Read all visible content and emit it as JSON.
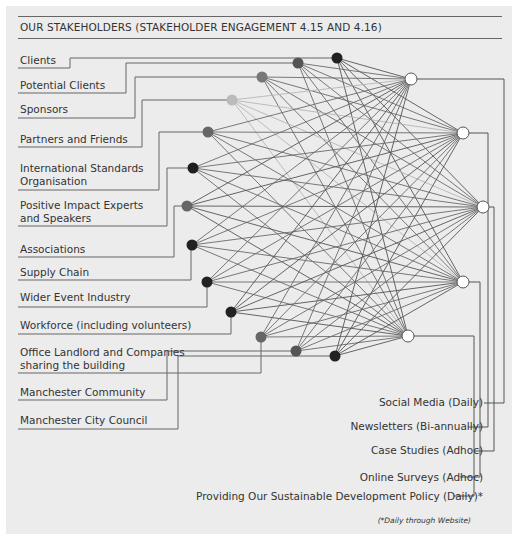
{
  "title": "OUR STAKEHOLDERS (STAKEHOLDER ENGAGEMENT 4.15 AND 4.16)",
  "stakeholders": [
    {
      "label": "Clients",
      "node_color": "#222222"
    },
    {
      "label": "Potential Clients",
      "node_color": "#555555"
    },
    {
      "label": "Sponsors",
      "node_color": "#777777"
    },
    {
      "label": "Partners and Friends",
      "node_color": "#bbbbbb"
    },
    {
      "label": "International Standards",
      "label2": "Organisation",
      "node_color": "#666666"
    },
    {
      "label": "Positive Impact Experts",
      "label2": "and Speakers",
      "node_color": "#1e1e1e"
    },
    {
      "label": "Associations",
      "node_color": "#666666"
    },
    {
      "label": "Supply Chain",
      "node_color": "#222222"
    },
    {
      "label": "Wider Event Industry",
      "node_color": "#222222"
    },
    {
      "label": "Workforce (including volunteers)",
      "node_color": "#222222"
    },
    {
      "label": "Office Landlord and Companies",
      "label2": "sharing the building",
      "node_color": "#666666"
    },
    {
      "label": "Manchester Community",
      "node_color": "#555555"
    },
    {
      "label": "Manchester City Council",
      "node_color": "#222222"
    }
  ],
  "channels": [
    {
      "label": "Social Media (Daily)"
    },
    {
      "label": "Newsletters (Bi-annually)"
    },
    {
      "label": "Case Studies (Adhoc)"
    },
    {
      "label": "Online Surveys (Adhoc)"
    },
    {
      "label": "Providing Our Sustainable Development Policy (Daily)*"
    }
  ],
  "footnote": "(*Daily through Website)"
}
